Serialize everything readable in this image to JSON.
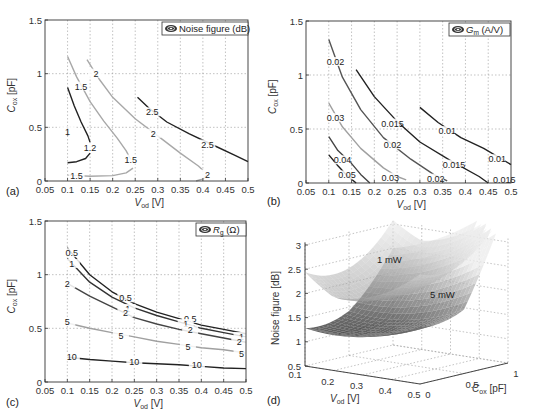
{
  "chart_data": [
    {
      "id": "a",
      "panel_label": "(a)",
      "type": "contour",
      "legend": "Noise figure (dB)",
      "xlabel": "V_od [V]",
      "ylabel": "C_ox [pF]",
      "xlim": [
        0.05,
        0.5
      ],
      "ylim": [
        0,
        1.5
      ],
      "xticks": [
        "0.05",
        "0.1",
        "0.15",
        "0.2",
        "0.25",
        "0.3",
        "0.35",
        "0.4",
        "0.45",
        "0.5"
      ],
      "yticks": [
        "0",
        "0.5",
        "1",
        "1.5"
      ],
      "grid": true,
      "contours": [
        {
          "level": "1",
          "color": "#222222",
          "points": [
            [
              0.1,
              0.42
            ],
            [
              0.1,
              0.5
            ]
          ],
          "labels": [
            [
              0.1,
              0.46
            ]
          ]
        },
        {
          "level": "1.2",
          "color": "#222222",
          "points": [
            [
              0.1,
              0.87
            ],
            [
              0.115,
              0.7
            ],
            [
              0.13,
              0.55
            ],
            [
              0.145,
              0.42
            ],
            [
              0.15,
              0.36
            ]
          ],
          "labels": [
            [
              0.15,
              0.31
            ]
          ]
        },
        {
          "level": "1.2",
          "color": "#222222",
          "points": [
            [
              0.1,
              0.17
            ],
            [
              0.12,
              0.18
            ],
            [
              0.14,
              0.21
            ],
            [
              0.15,
              0.26
            ]
          ],
          "labels": []
        },
        {
          "level": "1.5",
          "color": "#a8a8a8",
          "points": [
            [
              0.1,
              1.16
            ],
            [
              0.12,
              0.97
            ],
            [
              0.15,
              0.74
            ],
            [
              0.18,
              0.56
            ],
            [
              0.21,
              0.4
            ],
            [
              0.23,
              0.28
            ],
            [
              0.24,
              0.2
            ]
          ],
          "labels": [
            [
              0.13,
              0.88
            ],
            [
              0.24,
              0.2
            ]
          ]
        },
        {
          "level": "1.5",
          "color": "#a8a8a8",
          "points": [
            [
              0.1,
              0.055
            ],
            [
              0.15,
              0.045
            ],
            [
              0.2,
              0.05
            ],
            [
              0.23,
              0.075
            ],
            [
              0.245,
              0.12
            ]
          ],
          "labels": [
            [
              0.12,
              0.05
            ]
          ]
        },
        {
          "level": "2",
          "color": "#a8a8a8",
          "points": [
            [
              0.143,
              1.13
            ],
            [
              0.17,
              0.95
            ],
            [
              0.2,
              0.78
            ],
            [
              0.25,
              0.58
            ],
            [
              0.3,
              0.42
            ],
            [
              0.35,
              0.26
            ],
            [
              0.39,
              0.14
            ],
            [
              0.4,
              0.1
            ]
          ],
          "labels": [
            [
              0.163,
              1.0
            ],
            [
              0.29,
              0.44
            ]
          ]
        },
        {
          "level": "2",
          "color": "#a8a8a8",
          "points": [
            [
              0.385,
              0.0
            ],
            [
              0.4,
              0.02
            ],
            [
              0.41,
              0.06
            ]
          ],
          "labels": [
            [
              0.41,
              0.06
            ]
          ]
        },
        {
          "level": "2.5",
          "color": "#222222",
          "points": [
            [
              0.255,
              0.78
            ],
            [
              0.28,
              0.68
            ],
            [
              0.32,
              0.55
            ],
            [
              0.37,
              0.44
            ],
            [
              0.42,
              0.34
            ],
            [
              0.47,
              0.24
            ],
            [
              0.5,
              0.18
            ]
          ],
          "labels": [
            [
              0.288,
              0.64
            ],
            [
              0.41,
              0.34
            ]
          ]
        }
      ]
    },
    {
      "id": "b",
      "panel_label": "(b)",
      "type": "contour",
      "legend": "G_m (A/V)",
      "xlabel": "V_od [V]",
      "ylabel": "C_ox [pF]",
      "xlim": [
        0.05,
        0.5
      ],
      "ylim": [
        0,
        1.5
      ],
      "xticks": [
        "0.05",
        "0.1",
        "0.15",
        "0.2",
        "0.25",
        "0.3",
        "0.35",
        "0.4",
        "0.45",
        "0.5"
      ],
      "yticks": [
        "0",
        "0.5",
        "1",
        "1.5"
      ],
      "grid": true,
      "contours": [
        {
          "level": "0.05",
          "color": "#222222",
          "points": [
            [
              0.1,
              0.26
            ],
            [
              0.12,
              0.16
            ],
            [
              0.14,
              0.07
            ],
            [
              0.16,
              0.0
            ]
          ],
          "labels": [
            [
              0.14,
              0.07
            ]
          ]
        },
        {
          "level": "0.04",
          "color": "#444444",
          "points": [
            [
              0.1,
              0.43
            ],
            [
              0.12,
              0.3
            ],
            [
              0.15,
              0.18
            ],
            [
              0.17,
              0.08
            ],
            [
              0.19,
              0.0
            ]
          ],
          "labels": [
            [
              0.13,
              0.21
            ]
          ]
        },
        {
          "level": "0.03",
          "color": "#a0a0a0",
          "points": [
            [
              0.1,
              0.74
            ],
            [
              0.13,
              0.52
            ],
            [
              0.17,
              0.32
            ],
            [
              0.22,
              0.14
            ],
            [
              0.25,
              0.06
            ],
            [
              0.27,
              0.03
            ]
          ],
          "labels": [
            [
              0.115,
              0.6
            ],
            [
              0.235,
              0.05
            ]
          ]
        },
        {
          "level": "0.02",
          "color": "#555555",
          "points": [
            [
              0.1,
              1.33
            ],
            [
              0.13,
              0.98
            ],
            [
              0.17,
              0.68
            ],
            [
              0.22,
              0.42
            ],
            [
              0.28,
              0.22
            ],
            [
              0.33,
              0.08
            ],
            [
              0.36,
              0.02
            ]
          ],
          "labels": [
            [
              0.115,
              1.12
            ],
            [
              0.24,
              0.35
            ],
            [
              0.335,
              0.04
            ]
          ]
        },
        {
          "level": "0.015",
          "color": "#222222",
          "points": [
            [
              0.16,
              1.05
            ],
            [
              0.2,
              0.8
            ],
            [
              0.25,
              0.57
            ],
            [
              0.3,
              0.38
            ],
            [
              0.37,
              0.2
            ],
            [
              0.43,
              0.06
            ],
            [
              0.45,
              0.0
            ]
          ],
          "labels": [
            [
              0.24,
              0.55
            ],
            [
              0.375,
              0.17
            ],
            [
              0.485,
              0.03
            ]
          ]
        },
        {
          "level": "0.01",
          "color": "#222222",
          "points": [
            [
              0.3,
              0.7
            ],
            [
              0.34,
              0.56
            ],
            [
              0.39,
              0.42
            ],
            [
              0.44,
              0.32
            ],
            [
              0.5,
              0.17
            ]
          ],
          "labels": [
            [
              0.36,
              0.48
            ],
            [
              0.47,
              0.22
            ]
          ]
        }
      ]
    },
    {
      "id": "c",
      "panel_label": "(c)",
      "type": "contour",
      "legend": "R_g (Ω)",
      "xlabel": "V_od [V]",
      "ylabel": "C_ox [pF]",
      "xlim": [
        0.05,
        0.5
      ],
      "ylim": [
        0,
        1.5
      ],
      "xticks": [
        "0.05",
        "0.1",
        "0.15",
        "0.2",
        "0.25",
        "0.3",
        "0.35",
        "0.4",
        "0.45",
        "0.5"
      ],
      "yticks": [
        "0",
        "0.5",
        "1",
        "1.5"
      ],
      "grid": true,
      "contours": [
        {
          "level": "0.5",
          "color": "#222222",
          "points": [
            [
              0.1,
              1.25
            ],
            [
              0.15,
              1.0
            ],
            [
              0.2,
              0.84
            ],
            [
              0.25,
              0.73
            ],
            [
              0.3,
              0.65
            ],
            [
              0.35,
              0.59
            ],
            [
              0.4,
              0.53
            ],
            [
              0.45,
              0.49
            ],
            [
              0.5,
              0.45
            ]
          ],
          "labels": [
            [
              0.11,
              1.2
            ],
            [
              0.23,
              0.78
            ],
            [
              0.375,
              0.59
            ]
          ]
        },
        {
          "level": "1",
          "color": "#333333",
          "points": [
            [
              0.1,
              1.15
            ],
            [
              0.15,
              0.93
            ],
            [
              0.2,
              0.79
            ],
            [
              0.25,
              0.69
            ],
            [
              0.3,
              0.62
            ],
            [
              0.35,
              0.56
            ],
            [
              0.4,
              0.5
            ],
            [
              0.45,
              0.46
            ],
            [
              0.5,
              0.42
            ]
          ],
          "labels": [
            [
              0.11,
              1.1
            ],
            [
              0.235,
              0.68
            ],
            [
              0.365,
              0.54
            ],
            [
              0.49,
              0.42
            ]
          ]
        },
        {
          "level": "2",
          "color": "#444444",
          "points": [
            [
              0.1,
              0.92
            ],
            [
              0.15,
              0.8
            ],
            [
              0.2,
              0.7
            ],
            [
              0.25,
              0.6
            ],
            [
              0.3,
              0.54
            ],
            [
              0.35,
              0.49
            ],
            [
              0.4,
              0.45
            ],
            [
              0.45,
              0.41
            ],
            [
              0.5,
              0.37
            ]
          ],
          "labels": [
            [
              0.1,
              0.91
            ],
            [
              0.23,
              0.64
            ],
            [
              0.375,
              0.48
            ],
            [
              0.485,
              0.37
            ]
          ]
        },
        {
          "level": "5",
          "color": "#a0a0a0",
          "points": [
            [
              0.1,
              0.55
            ],
            [
              0.15,
              0.5
            ],
            [
              0.2,
              0.46
            ],
            [
              0.25,
              0.42
            ],
            [
              0.3,
              0.38
            ],
            [
              0.35,
              0.35
            ],
            [
              0.4,
              0.32
            ],
            [
              0.45,
              0.3
            ],
            [
              0.5,
              0.27
            ]
          ],
          "labels": [
            [
              0.1,
              0.56
            ],
            [
              0.22,
              0.43
            ],
            [
              0.37,
              0.33
            ],
            [
              0.49,
              0.26
            ]
          ]
        },
        {
          "level": "10",
          "color": "#222222",
          "points": [
            [
              0.1,
              0.23
            ],
            [
              0.15,
              0.21
            ],
            [
              0.2,
              0.195
            ],
            [
              0.25,
              0.18
            ],
            [
              0.3,
              0.17
            ],
            [
              0.35,
              0.16
            ],
            [
              0.4,
              0.145
            ],
            [
              0.45,
              0.13
            ],
            [
              0.5,
              0.125
            ]
          ],
          "labels": [
            [
              0.11,
              0.23
            ],
            [
              0.25,
              0.185
            ],
            [
              0.39,
              0.155
            ]
          ]
        }
      ]
    },
    {
      "id": "d",
      "panel_label": "(d)",
      "type": "surface3d",
      "zlabel": "Noise figure [dB]",
      "xlabel": "V_od [V]",
      "ylabel": "C_ox [pF]",
      "xticks": [
        "0.1",
        "0.2",
        "0.3",
        "0.4",
        "0.5"
      ],
      "yticks": [
        "0",
        "0.5",
        "1"
      ],
      "zticks": [
        "0.5",
        "1",
        "1.5",
        "2",
        "2.5",
        "3"
      ],
      "zlim": [
        0.5,
        3
      ],
      "surfaces": [
        {
          "name": "1 mW",
          "label": "1 mW",
          "min_nf_db": 1.85,
          "shade": "light"
        },
        {
          "name": "5 mW",
          "label": "5 mW",
          "min_nf_db": 1.2,
          "shade": "dark"
        }
      ]
    }
  ]
}
